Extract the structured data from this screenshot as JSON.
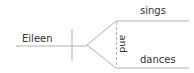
{
  "diagram": {
    "type": "sentence-diagram",
    "subject": "Eileen",
    "conjunction": "and",
    "verbs": [
      "sings",
      "dances"
    ],
    "colors": {
      "line": "#b0b0b0",
      "text": "#333333"
    }
  }
}
